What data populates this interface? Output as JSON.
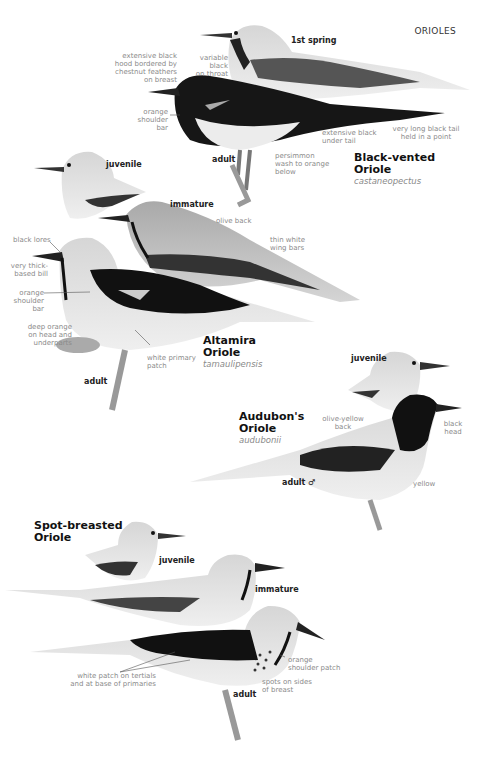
{
  "page": {
    "header": "ORIOLES"
  },
  "species": [
    {
      "name_line1": "Black-vented",
      "name_line2": "Oriole",
      "scientific": "castaneopectus",
      "labels": {
        "first_spring": "1st spring",
        "adult": "adult"
      },
      "notes": {
        "hood": [
          "extensive black",
          "hood bordered by",
          "chestnut feathers",
          "on breast"
        ],
        "throat": [
          "variable black",
          "on throat"
        ],
        "shoulder": [
          "orange",
          "shoulder",
          "bar"
        ],
        "undertail": [
          "extensive black",
          "under tail"
        ],
        "tail": [
          "very long black tail",
          "held in a point"
        ],
        "below": [
          "persimmon",
          "wash to orange",
          "below"
        ]
      }
    },
    {
      "name_line1": "Altamira",
      "name_line2": "Oriole",
      "scientific": "tamaulipensis",
      "labels": {
        "juvenile": "juvenile",
        "immature": "immature",
        "adult": "adult"
      },
      "notes": {
        "olive_back": "olive back",
        "wing_bars": [
          "thin white",
          "wing bars"
        ],
        "lores": "black lores",
        "bill": [
          "very thick-",
          "based bill"
        ],
        "shoulder": [
          "orange",
          "shoulder",
          "bar"
        ],
        "head": [
          "deep orange",
          "on head and",
          "underparts"
        ],
        "primary": [
          "white primary",
          "patch"
        ]
      }
    },
    {
      "name_line1": "Audubon's",
      "name_line2": "Oriole",
      "scientific": "audubonii",
      "labels": {
        "juvenile": "juvenile",
        "adult": "adult ♂"
      },
      "notes": {
        "back": [
          "olive-yellow",
          "back"
        ],
        "head": [
          "black",
          "head"
        ],
        "yellow": "yellow"
      }
    },
    {
      "name_line1": "Spot-breasted",
      "name_line2": "Oriole",
      "scientific": "",
      "labels": {
        "juvenile": "juvenile",
        "immature": "immature",
        "adult": "adult"
      },
      "notes": {
        "patch": [
          "white patch on tertials",
          "and at base of primaries"
        ],
        "shoulder": [
          "orange",
          "shoulder patch"
        ],
        "spots": [
          "spots on sides",
          "of breast"
        ]
      }
    }
  ]
}
